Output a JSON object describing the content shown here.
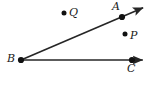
{
  "figure": {
    "type": "geometry-diagram",
    "width": 154,
    "height": 85,
    "background_color": "#ffffff",
    "stroke_color": "#262626",
    "point_color": "#111111",
    "label_color": "#1a1a1a",
    "points": [
      {
        "id": "B",
        "label": "B",
        "x": 21,
        "y": 60,
        "dot_radius": 3.1,
        "label_x": 7,
        "label_y": 53,
        "on_ray": "both",
        "kind": "vertex"
      },
      {
        "id": "A",
        "label": "A",
        "x": 122,
        "y": 17,
        "dot_radius": 3.1,
        "label_x": 112,
        "label_y": 1,
        "on_ray": "BA",
        "kind": "ray-point"
      },
      {
        "id": "C",
        "label": "C",
        "x": 132,
        "y": 60,
        "dot_radius": 3.1,
        "label_x": 127,
        "label_y": 63,
        "on_ray": "BC",
        "kind": "ray-point"
      },
      {
        "id": "Q",
        "label": "Q",
        "x": 64,
        "y": 13,
        "dot_radius": 2.5,
        "label_x": 69,
        "label_y": 7,
        "on_ray": "none",
        "kind": "free-point"
      },
      {
        "id": "P",
        "label": "P",
        "x": 125,
        "y": 34,
        "dot_radius": 2.5,
        "label_x": 130,
        "label_y": 30,
        "on_ray": "none",
        "kind": "free-point"
      }
    ],
    "rays": [
      {
        "id": "ray-BA",
        "from": "B",
        "through": "A",
        "start_x": 21,
        "start_y": 60,
        "end_x": 147,
        "end_y": 6,
        "arrow_at_end": true,
        "stroke_width": 1.6
      },
      {
        "id": "ray-BC",
        "from": "B",
        "through": "C",
        "start_x": 21,
        "start_y": 60,
        "end_x": 147,
        "end_y": 60,
        "arrow_at_end": true,
        "stroke_width": 1.6
      }
    ],
    "labels_text": {
      "A": "A",
      "B": "B",
      "C": "C",
      "P": "P",
      "Q": "Q"
    }
  }
}
